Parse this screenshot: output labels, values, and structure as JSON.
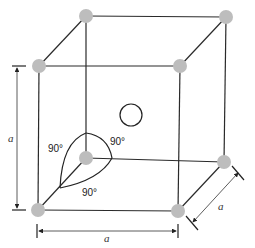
{
  "diagram": {
    "type": "simple cubic unit cell with interaxial angles",
    "dimension_labels": {
      "vertical": "a",
      "horizontal": "a",
      "depth": "a"
    },
    "angle_labels": {
      "left": "90°",
      "right": "90°",
      "bottom": "90°"
    },
    "colors": {
      "corner_atom": "#bdbdbd",
      "edges": "#2a2a2a",
      "center_marker_fill": "#ffffff"
    }
  }
}
